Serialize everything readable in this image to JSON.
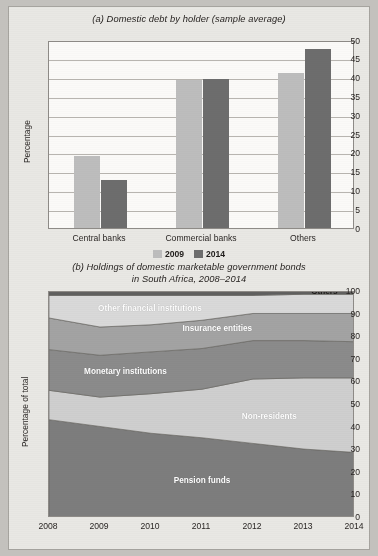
{
  "figure": {
    "background_color": "#c3c1bd",
    "paper_color": "#e9e8e4"
  },
  "panel_a": {
    "title": "(a) Domestic debt by holder (sample average)",
    "legend": [
      {
        "label": "2009",
        "color": "#bdbdbd"
      },
      {
        "label": "2014",
        "color": "#6d6d6d"
      }
    ],
    "chart_data": {
      "type": "bar",
      "title": "(a) Domestic debt by holder (sample average)",
      "xlabel": "",
      "ylabel": "Percentage",
      "ylim": [
        0,
        50
      ],
      "yticks": [
        0,
        5,
        10,
        15,
        20,
        25,
        30,
        35,
        40,
        45,
        50
      ],
      "grid": true,
      "legend_position": "bottom",
      "categories": [
        "Central banks",
        "Commercial banks",
        "Others"
      ],
      "series": [
        {
          "name": "2009",
          "color": "#bdbdbd",
          "values": [
            19.0,
            39.2,
            41.0
          ]
        },
        {
          "name": "2014",
          "color": "#6d6d6d",
          "values": [
            12.7,
            39.4,
            47.5
          ]
        }
      ]
    }
  },
  "panel_b": {
    "title_line1": "(b) Holdings of domestic marketable government bonds",
    "title_line2": "in South Africa, 2008–2014",
    "chart_data": {
      "type": "area",
      "title": "(b) Holdings of domestic marketable government bonds in South Africa, 2008–2014",
      "xlabel": "",
      "ylabel": "Percentage of total",
      "ylim": [
        0,
        100
      ],
      "yticks": [
        0,
        10,
        20,
        30,
        40,
        50,
        60,
        70,
        80,
        90,
        100
      ],
      "grid": false,
      "stacked": true,
      "legend_position": "inline-labels",
      "x": [
        2008,
        2009,
        2010,
        2011,
        2012,
        2013,
        2014
      ],
      "xticks": [
        "2008",
        "2009",
        "2010",
        "2011",
        "2012",
        "2013",
        "2014"
      ],
      "series": [
        {
          "name": "Pension funds",
          "color": "#7d7d7d",
          "values": [
            43.5,
            40.5,
            37.5,
            35.5,
            33.0,
            30.5,
            29.0
          ]
        },
        {
          "name": "Non-residents",
          "color": "#cfcfcf",
          "values": [
            13.0,
            13.0,
            17.5,
            21.5,
            28.5,
            31.5,
            33.0
          ]
        },
        {
          "name": "Monetary institutions",
          "color": "#8b8b8b",
          "values": [
            18.0,
            18.5,
            18.5,
            18.0,
            17.0,
            16.5,
            16.0
          ]
        },
        {
          "name": "Insurance entities",
          "color": "#a3a3a3",
          "values": [
            14.0,
            12.5,
            12.0,
            12.5,
            12.0,
            12.0,
            12.5
          ]
        },
        {
          "name": "Other financial institutions",
          "color": "#d9d9d9",
          "values": [
            10.0,
            14.0,
            13.0,
            11.0,
            8.0,
            8.5,
            8.5
          ]
        },
        {
          "name": "Others",
          "color": "#5f5f5f",
          "values": [
            1.5,
            1.5,
            1.5,
            1.5,
            1.5,
            1.0,
            1.0
          ]
        }
      ],
      "inline_labels": [
        {
          "text": "Pension funds",
          "x_frac": 0.5,
          "y_pct": 17,
          "style": "light"
        },
        {
          "text": "Non-residents",
          "x_frac": 0.72,
          "y_pct": 45,
          "style": "light"
        },
        {
          "text": "Monetary institutions",
          "x_frac": 0.25,
          "y_pct": 65,
          "style": "light"
        },
        {
          "text": "Insurance entities",
          "x_frac": 0.55,
          "y_pct": 84,
          "style": "light"
        },
        {
          "text": "Other financial institutions",
          "x_frac": 0.33,
          "y_pct": 93,
          "style": "light"
        },
        {
          "text": "Others",
          "x_frac": 0.9,
          "y_pct": 100.5,
          "style": "dark"
        }
      ]
    }
  }
}
